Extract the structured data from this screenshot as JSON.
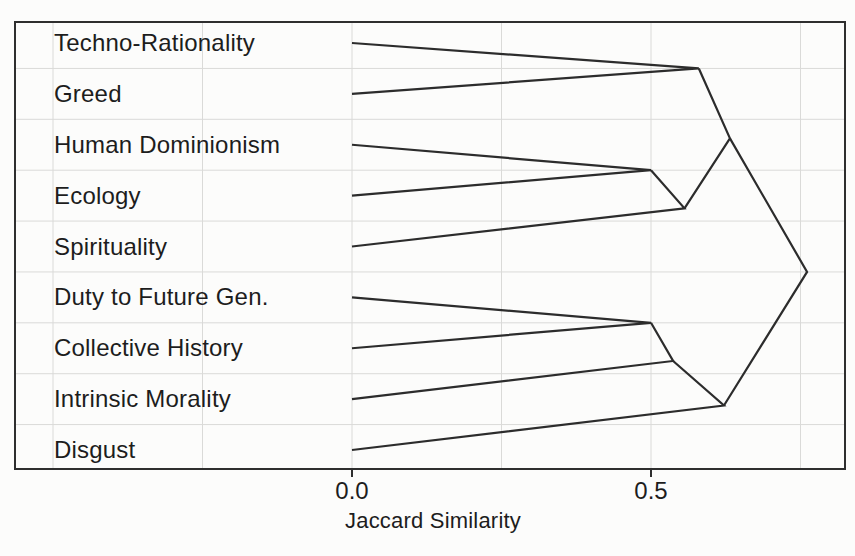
{
  "figure": {
    "background": "#fcfcfb",
    "border_color": "#2e2e2e",
    "line_color": "#2c2c2c",
    "grid_color": "#dadad8",
    "text_color": "#1d1d1d"
  },
  "chart_data": {
    "type": "dendrogram",
    "orientation": "right",
    "link_style": "triangle",
    "title": "",
    "xlabel": "Jaccard Similarity",
    "ylabel": "",
    "x_ticks": [
      0.0,
      0.5
    ],
    "x_tick_labels": [
      "0.0",
      "0.5"
    ],
    "x_gridlines": [
      -0.5,
      -0.25,
      0.0,
      0.25,
      0.5,
      0.75
    ],
    "xlim": [
      -0.563,
      0.824
    ],
    "grid": true,
    "leaf_similarity": 0.0,
    "leaves": [
      "Techno-Rationality",
      "Greed",
      "Human Dominionism",
      "Ecology",
      "Spirituality",
      "Duty to Future Gen.",
      "Collective History",
      "Intrinsic Morality",
      "Disgust"
    ],
    "merges": [
      {
        "id": "n1",
        "children": [
          "Techno-Rationality",
          "Greed"
        ],
        "similarity": 0.58
      },
      {
        "id": "n2",
        "children": [
          "Human Dominionism",
          "Ecology"
        ],
        "similarity": 0.5
      },
      {
        "id": "n3",
        "children": [
          "n2",
          "Spirituality"
        ],
        "similarity": 0.556
      },
      {
        "id": "n4",
        "children": [
          "n1",
          "n3"
        ],
        "similarity": 0.632
      },
      {
        "id": "n5",
        "children": [
          "Duty to Future Gen.",
          "Collective History"
        ],
        "similarity": 0.5
      },
      {
        "id": "n6",
        "children": [
          "n5",
          "Intrinsic Morality"
        ],
        "similarity": 0.537
      },
      {
        "id": "n7",
        "children": [
          "n6",
          "Disgust"
        ],
        "similarity": 0.622
      },
      {
        "id": "n8",
        "children": [
          "n4",
          "n7"
        ],
        "similarity": 0.761
      }
    ]
  }
}
